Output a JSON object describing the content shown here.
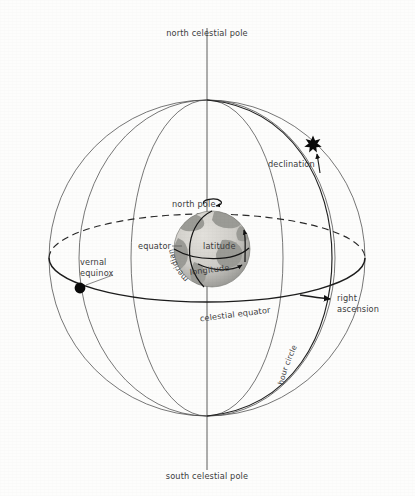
{
  "figure": {
    "background_color": "#fdfdfc",
    "line_color": "#4a4a4a",
    "accent_color": "#0a0a0a"
  },
  "labels": {
    "north_celestial_pole": "north celestial pole",
    "south_celestial_pole": "south celestial pole",
    "declination": "declination",
    "right_ascension_line1": "right",
    "right_ascension_line2": "ascension",
    "vernal_equinox_line1": "vernal",
    "vernal_equinox_line2": "equinox",
    "celestial_equator": "celestial equator",
    "hour_circle": "hour circle",
    "north_pole": "north pole",
    "equator": "equator",
    "meridian": "meridian",
    "latitude": "latitude",
    "longitude": "longitude"
  },
  "markers": {
    "star": {
      "name": "star-marker",
      "glyph": "star",
      "x": 313,
      "y": 143
    },
    "vernal_equinox_dot": {
      "name": "vernal-equinox-dot",
      "glyph": "filled-circle",
      "x": 80,
      "y": 288
    },
    "right_ascension_arrow": {
      "name": "right-ascension-arrow",
      "glyph": "arrowhead",
      "x": 331,
      "y": 298
    },
    "declination_arrow": {
      "name": "declination-arrow",
      "glyph": "arrowhead",
      "x": 318,
      "y": 153
    },
    "rotation_arrow": {
      "name": "earth-rotation-arrow",
      "glyph": "circular-arrow",
      "x": 212,
      "y": 203
    }
  },
  "geometry": {
    "sphere_center_x": 207,
    "sphere_center_y": 258,
    "sphere_radius": 158,
    "globe_center_x": 212,
    "globe_center_y": 249,
    "globe_radius": 38,
    "axis_top_y": 28,
    "axis_bottom_y": 470
  },
  "colors": {
    "globe_ocean": "#d4d2cd",
    "globe_land": "#9b9b96",
    "globe_shadow": "#7e7e7a",
    "dashed_stroke": "#2a2a2a",
    "bold_stroke": "#1c1c1c"
  }
}
